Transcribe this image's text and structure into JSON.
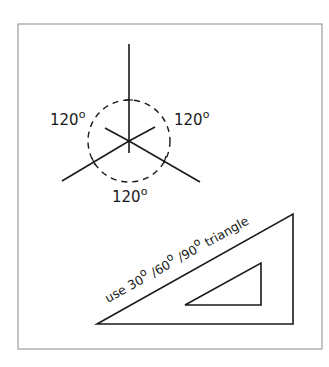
{
  "diagram": {
    "frame": {
      "x": 18,
      "y": 24,
      "width": 304,
      "height": 325,
      "color": "#8a8a8a"
    },
    "axes": {
      "center": [
        129,
        141
      ],
      "arm_up_end": [
        129,
        44
      ],
      "arm_left_end": [
        62,
        181
      ],
      "arm_right_end": [
        200,
        182
      ],
      "circle_radius": 41,
      "stroke": "#1a1a1a"
    },
    "angle_labels": [
      {
        "id": "left",
        "value": "120",
        "unit": "o"
      },
      {
        "id": "right",
        "value": "120",
        "unit": "o"
      },
      {
        "id": "bottom",
        "value": "120",
        "unit": "o"
      }
    ],
    "triangle_note": {
      "parts": [
        "use 30",
        "o",
        " /60",
        "o",
        " /90",
        "o",
        " triangle"
      ]
    },
    "outer_triangle": [
      [
        97,
        324
      ],
      [
        293,
        214
      ],
      [
        293,
        324
      ]
    ],
    "inner_triangle": [
      [
        185,
        305
      ],
      [
        261,
        263
      ],
      [
        261,
        305
      ]
    ]
  }
}
